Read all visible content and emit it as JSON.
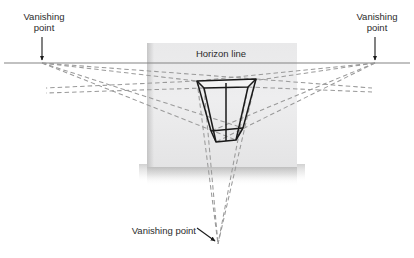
{
  "figure": {
    "title_text": null,
    "labels": {
      "vanishing_point_left_line1": "Vanishing",
      "vanishing_point_left_line2": "point",
      "vanishing_point_right_line1": "Vanishing",
      "vanishing_point_right_line2": "point",
      "vanishing_point_bottom": "Vanishing point",
      "horizon_line": "Horizon line"
    },
    "colors": {
      "background": "#ffffff",
      "panel_fill": "#ececed",
      "panel_shadow": "#b8b8b8",
      "horizon_line": "#808080",
      "construction_line": "#9a9a9a",
      "box_outline": "#1a1a1a",
      "text": "#2b2b2b",
      "arrow": "#1a1a1a"
    },
    "geometry": {
      "horizon_y": 63,
      "vanishing_point_left": {
        "x": 42,
        "y": 63
      },
      "vanishing_point_right": {
        "x": 375,
        "y": 63
      },
      "vanishing_point_bottom": {
        "x": 218,
        "y": 244
      },
      "panel": {
        "x": 147,
        "y": 43,
        "width": 150,
        "height": 124
      },
      "box_top_face": [
        {
          "x": 197,
          "y": 81
        },
        {
          "x": 256,
          "y": 79
        },
        {
          "x": 248,
          "y": 87
        },
        {
          "x": 204,
          "y": 88
        }
      ],
      "box_bottom_face": [
        {
          "x": 211,
          "y": 131
        },
        {
          "x": 243,
          "y": 128
        },
        {
          "x": 236,
          "y": 140
        },
        {
          "x": 216,
          "y": 142
        }
      ],
      "box_vertical_edges": [
        {
          "x1": 197,
          "y1": 81,
          "x2": 211,
          "y2": 131
        },
        {
          "x1": 256,
          "y1": 79,
          "x2": 243,
          "y2": 128
        },
        {
          "x1": 204,
          "y1": 88,
          "x2": 216,
          "y2": 142
        },
        {
          "x1": 248,
          "y1": 87,
          "x2": 236,
          "y2": 140
        }
      ],
      "arrow_left": {
        "x": 42,
        "y1": 38,
        "y2": 61
      },
      "arrow_right": {
        "x": 375,
        "y1": 38,
        "y2": 61
      },
      "arrow_bottom": {
        "x1": 199,
        "y1": 229,
        "x2": 216,
        "y2": 242
      }
    },
    "label_positions": {
      "vp_left": {
        "x": 44,
        "y": 20
      },
      "vp_right": {
        "x": 377,
        "y": 20
      },
      "vp_bottom": {
        "x": 196,
        "y": 234
      },
      "horizon": {
        "x": 221,
        "y": 57
      }
    }
  }
}
